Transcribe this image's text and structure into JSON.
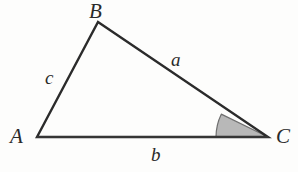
{
  "figure": {
    "type": "triangle-diagram",
    "background_color": "#fdfdfc",
    "stroke_color": "#2b2b2b",
    "shaded_angle_fill": "#b8b8b8",
    "shaded_angle_stroke": "#6f6f6f"
  },
  "vertices": [
    {
      "id": "A",
      "label": "A",
      "x": 37,
      "y": 137
    },
    {
      "id": "B",
      "label": "B",
      "x": 98,
      "y": 22
    },
    {
      "id": "C",
      "label": "C",
      "x": 268,
      "y": 137
    }
  ],
  "sides": [
    {
      "id": "a",
      "label": "a",
      "from": "B",
      "to": "C",
      "note": "side opposite vertex A"
    },
    {
      "id": "b",
      "label": "b",
      "from": "A",
      "to": "C",
      "note": "side opposite vertex B, the base"
    },
    {
      "id": "c",
      "label": "c",
      "from": "A",
      "to": "B",
      "note": "side opposite vertex C"
    }
  ],
  "angle_marker": {
    "at_vertex": "C",
    "shaded": true,
    "radius": 52
  },
  "geometry": {
    "path_triangle": "M 37 137 L 98 22 L 268 137 Z",
    "path_angle_sector": "M 268 137 L 216 137 A 52 52 0 0 1 221.28 114.15 Z"
  }
}
